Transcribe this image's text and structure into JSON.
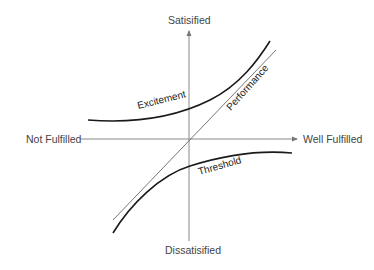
{
  "diagram": {
    "type": "kano-model",
    "axes": {
      "top": "Satisified",
      "bottom": "Dissatisified",
      "left": "Not Fulfilled",
      "right": "Well Fulfilled"
    },
    "curves": [
      {
        "name": "Excitement",
        "label": "Excitement",
        "style": "thick-curve"
      },
      {
        "name": "Performance",
        "label": "Performance",
        "style": "thin-line"
      },
      {
        "name": "Threshold",
        "label": "Threshold",
        "style": "thick-curve"
      }
    ],
    "colors": {
      "axis": "#777777",
      "curve": "#1a1a1a",
      "performance_line": "#666666",
      "text": "#444444"
    }
  }
}
